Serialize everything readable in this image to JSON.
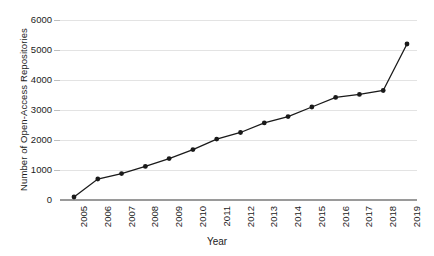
{
  "chart_data": {
    "type": "line",
    "title": "",
    "xlabel": "Year",
    "ylabel": "Number of Open-Access Repositories",
    "categories": [
      "2005",
      "2006",
      "2007",
      "2008",
      "2009",
      "2010",
      "2011",
      "2012",
      "2013",
      "2014",
      "2015",
      "2016",
      "2017",
      "2018",
      "2019"
    ],
    "values": [
      100,
      700,
      880,
      1120,
      1380,
      1680,
      2030,
      2250,
      2570,
      2780,
      3100,
      3420,
      3520,
      3650,
      5200
    ],
    "series": [
      {
        "name": "Open-Access Repositories",
        "values": [
          100,
          700,
          880,
          1120,
          1380,
          1680,
          2030,
          2250,
          2570,
          2780,
          3100,
          3420,
          3520,
          3650,
          5200
        ]
      }
    ],
    "yticks": [
      0,
      1000,
      2000,
      3000,
      4000,
      5000,
      6000
    ],
    "ytick_labels": [
      "0",
      "1000",
      "2000",
      "3000",
      "4000",
      "5000",
      "6000"
    ],
    "ylim": [
      0,
      6000
    ],
    "xlim_categories": [
      "2005",
      "2019"
    ],
    "grid": true,
    "grid_axis": "y",
    "legend": "none",
    "marker": "circle",
    "line_color": "#1a1a1a",
    "marker_color": "#1a1a1a",
    "grid_color": "#e3e3e3",
    "axis_color": "#9a9a9a",
    "background": "#ffffff",
    "xtick_rotation": 90
  }
}
